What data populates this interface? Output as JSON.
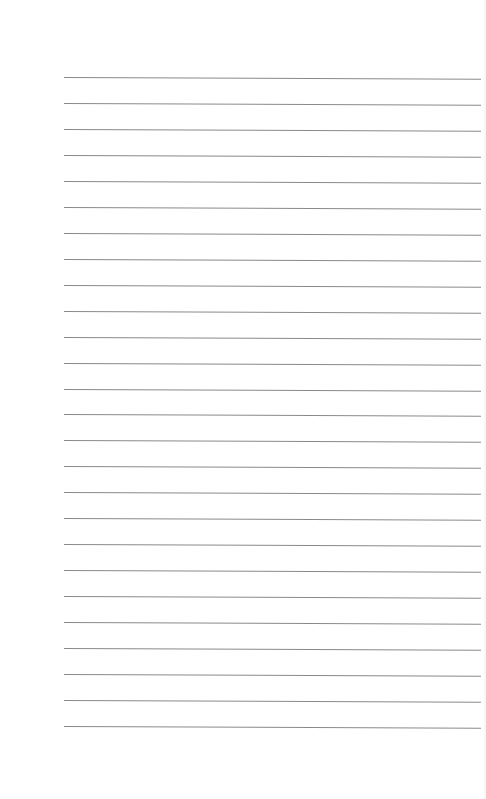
{
  "page": {
    "type": "lined-paper",
    "background": "#ffffff",
    "rule_color": "#8a8a8a",
    "rule_count": 26,
    "rule_left_px": 64,
    "rule_right_px": 481,
    "first_rule_y_px": 77,
    "rule_spacing_px": 25.96
  }
}
